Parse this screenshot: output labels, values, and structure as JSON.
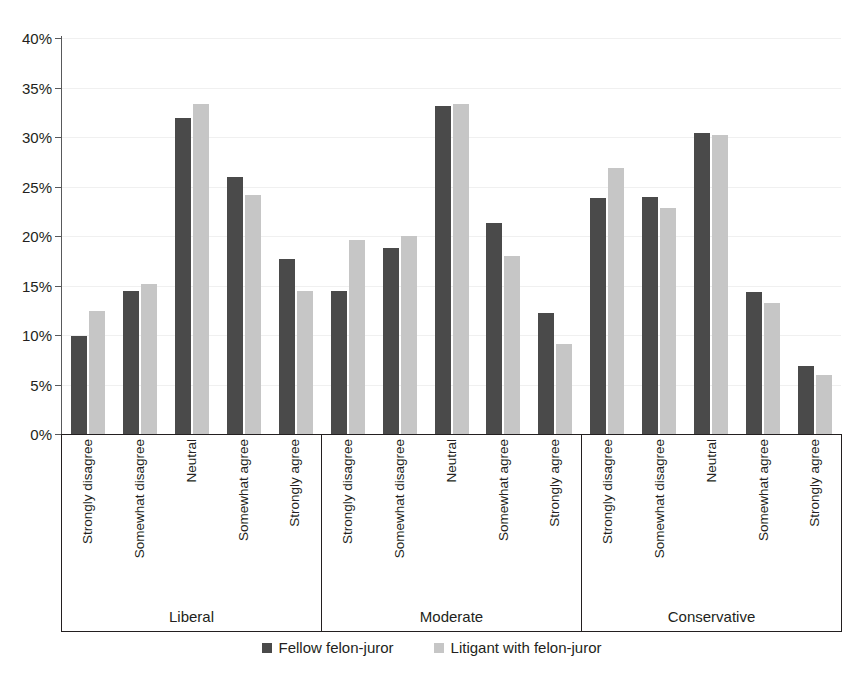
{
  "chart_data": {
    "type": "bar",
    "title": "",
    "subtitle": "",
    "xlabel": "",
    "ylabel": "",
    "ylim": [
      0,
      40
    ],
    "ytick_labels": [
      "0%",
      "5%",
      "10%",
      "15%",
      "20%",
      "25%",
      "30%",
      "35%",
      "40%"
    ],
    "ytick_values": [
      0,
      5,
      10,
      15,
      20,
      25,
      30,
      35,
      40
    ],
    "grid": true,
    "legend_position": "bottom",
    "categories": [
      "Strongly disagree",
      "Somewhat disagree",
      "Neutral",
      "Somewhat agree",
      "Strongly agree"
    ],
    "groups": [
      "Liberal",
      "Moderate",
      "Conservative"
    ],
    "series": [
      {
        "name": "Fellow felon-juror",
        "color": "#4a4a4a",
        "values": {
          "Liberal": [
            9.9,
            14.4,
            31.9,
            26.0,
            17.7
          ],
          "Moderate": [
            14.4,
            18.8,
            33.1,
            21.3,
            12.2
          ],
          "Conservative": [
            23.8,
            23.9,
            30.4,
            14.3,
            6.9
          ]
        }
      },
      {
        "name": "Litigant with felon-juror",
        "color": "#c6c6c6",
        "values": {
          "Liberal": [
            12.4,
            15.2,
            33.3,
            24.1,
            14.4
          ],
          "Moderate": [
            19.6,
            20.0,
            33.3,
            18.0,
            9.1
          ],
          "Conservative": [
            26.9,
            22.8,
            30.2,
            13.2,
            6.0
          ]
        }
      }
    ]
  },
  "legend": {
    "items": [
      {
        "label": "Fellow felon-juror",
        "color": "#4a4a4a"
      },
      {
        "label": "Litigant with felon-juror",
        "color": "#c6c6c6"
      }
    ]
  }
}
